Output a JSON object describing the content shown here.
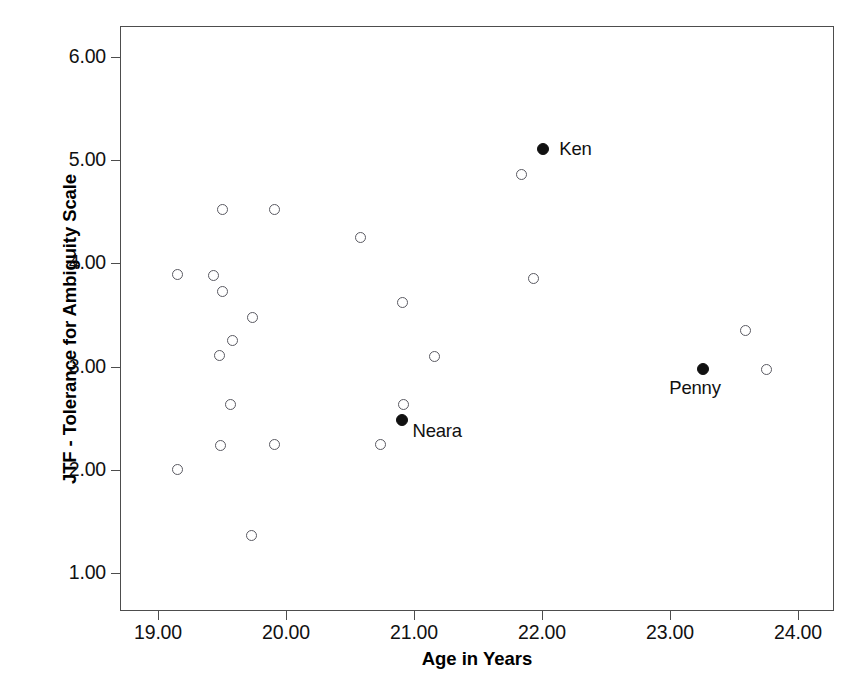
{
  "chart_data": {
    "type": "scatter",
    "title": "",
    "xlabel": "Age in Years",
    "ylabel": "JTF - Tolerance for Ambiguity Scale",
    "xlim": [
      18.7,
      24.28
    ],
    "ylim": [
      0.77,
      6.3
    ],
    "xticks": [
      "19.00",
      "20.00",
      "21.00",
      "22.00",
      "23.00",
      "24.00"
    ],
    "xtick_values": [
      19.0,
      20.0,
      21.0,
      22.0,
      23.0,
      24.0
    ],
    "yticks": [
      "1.00",
      "2.00",
      "3.00",
      "4.00",
      "5.00",
      "6.00"
    ],
    "ytick_values": [
      1.0,
      2.0,
      3.0,
      4.0,
      5.0,
      6.0
    ],
    "grid": false,
    "legend": false,
    "marker_open": "open-circle",
    "marker_filled": "filled-circle",
    "points": [
      {
        "x": 19.15,
        "y": 3.89,
        "filled": false,
        "label": ""
      },
      {
        "x": 19.43,
        "y": 3.88,
        "filled": false,
        "label": ""
      },
      {
        "x": 19.5,
        "y": 4.52,
        "filled": false,
        "label": ""
      },
      {
        "x": 19.5,
        "y": 3.73,
        "filled": false,
        "label": ""
      },
      {
        "x": 19.48,
        "y": 3.11,
        "filled": false,
        "label": ""
      },
      {
        "x": 19.58,
        "y": 3.25,
        "filled": false,
        "label": ""
      },
      {
        "x": 19.74,
        "y": 3.48,
        "filled": false,
        "label": ""
      },
      {
        "x": 19.57,
        "y": 2.63,
        "filled": false,
        "label": ""
      },
      {
        "x": 19.49,
        "y": 2.24,
        "filled": false,
        "label": ""
      },
      {
        "x": 19.91,
        "y": 4.52,
        "filled": false,
        "label": ""
      },
      {
        "x": 19.91,
        "y": 2.25,
        "filled": false,
        "label": ""
      },
      {
        "x": 19.15,
        "y": 2.0,
        "filled": false,
        "label": ""
      },
      {
        "x": 19.73,
        "y": 1.36,
        "filled": false,
        "label": ""
      },
      {
        "x": 20.58,
        "y": 4.25,
        "filled": false,
        "label": ""
      },
      {
        "x": 20.91,
        "y": 3.62,
        "filled": false,
        "label": ""
      },
      {
        "x": 21.16,
        "y": 3.1,
        "filled": false,
        "label": ""
      },
      {
        "x": 20.92,
        "y": 2.63,
        "filled": false,
        "label": ""
      },
      {
        "x": 20.74,
        "y": 2.25,
        "filled": false,
        "label": ""
      },
      {
        "x": 20.91,
        "y": 2.48,
        "filled": true,
        "label": "Neara"
      },
      {
        "x": 21.84,
        "y": 4.86,
        "filled": false,
        "label": ""
      },
      {
        "x": 22.01,
        "y": 5.11,
        "filled": true,
        "label": "Ken"
      },
      {
        "x": 21.93,
        "y": 3.85,
        "filled": false,
        "label": ""
      },
      {
        "x": 23.59,
        "y": 3.35,
        "filled": false,
        "label": ""
      },
      {
        "x": 23.75,
        "y": 2.97,
        "filled": false,
        "label": ""
      },
      {
        "x": 23.26,
        "y": 2.98,
        "filled": true,
        "label": "Penny"
      }
    ],
    "point_labels": [
      {
        "text": "Ken",
        "x": 22.01,
        "y": 5.11
      },
      {
        "text": "Neara",
        "x": 20.91,
        "y": 2.48
      },
      {
        "text": "Penny",
        "x": 23.26,
        "y": 2.98
      }
    ],
    "n_points": 25,
    "n_highlighted": 3
  },
  "axis": {
    "x_title": "Age in Years",
    "y_title": "JTF - Tolerance for Ambiguity Scale"
  },
  "colors": {
    "frame": "#4d4d4d",
    "marker_outline": "#5a5a62",
    "marker_fill": "#111111",
    "text": "#111111",
    "background": "#ffffff"
  }
}
